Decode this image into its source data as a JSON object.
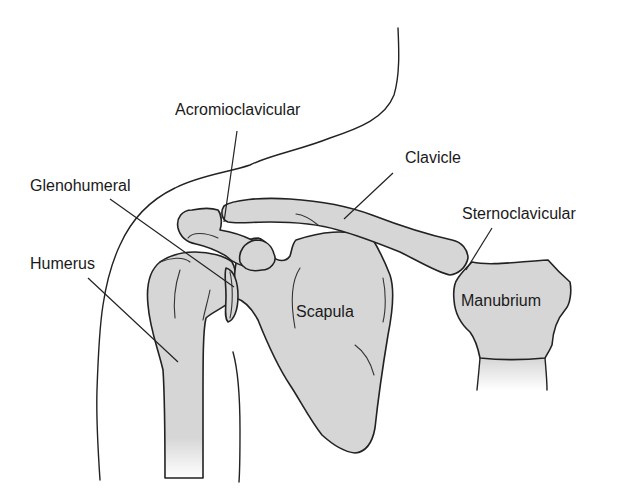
{
  "diagram": {
    "colors": {
      "bone_fill": "#d6d6d6",
      "line": "#222222",
      "background": "#ffffff",
      "text": "#1a1a1a"
    },
    "labels": {
      "acromioclavicular": "Acromioclavicular",
      "clavicle": "Clavicle",
      "glenohumeral": "Glenohumeral",
      "sternoclavicular": "Sternoclavicular",
      "humerus": "Humerus",
      "scapula": "Scapula",
      "manubrium": "Manubrium"
    }
  }
}
